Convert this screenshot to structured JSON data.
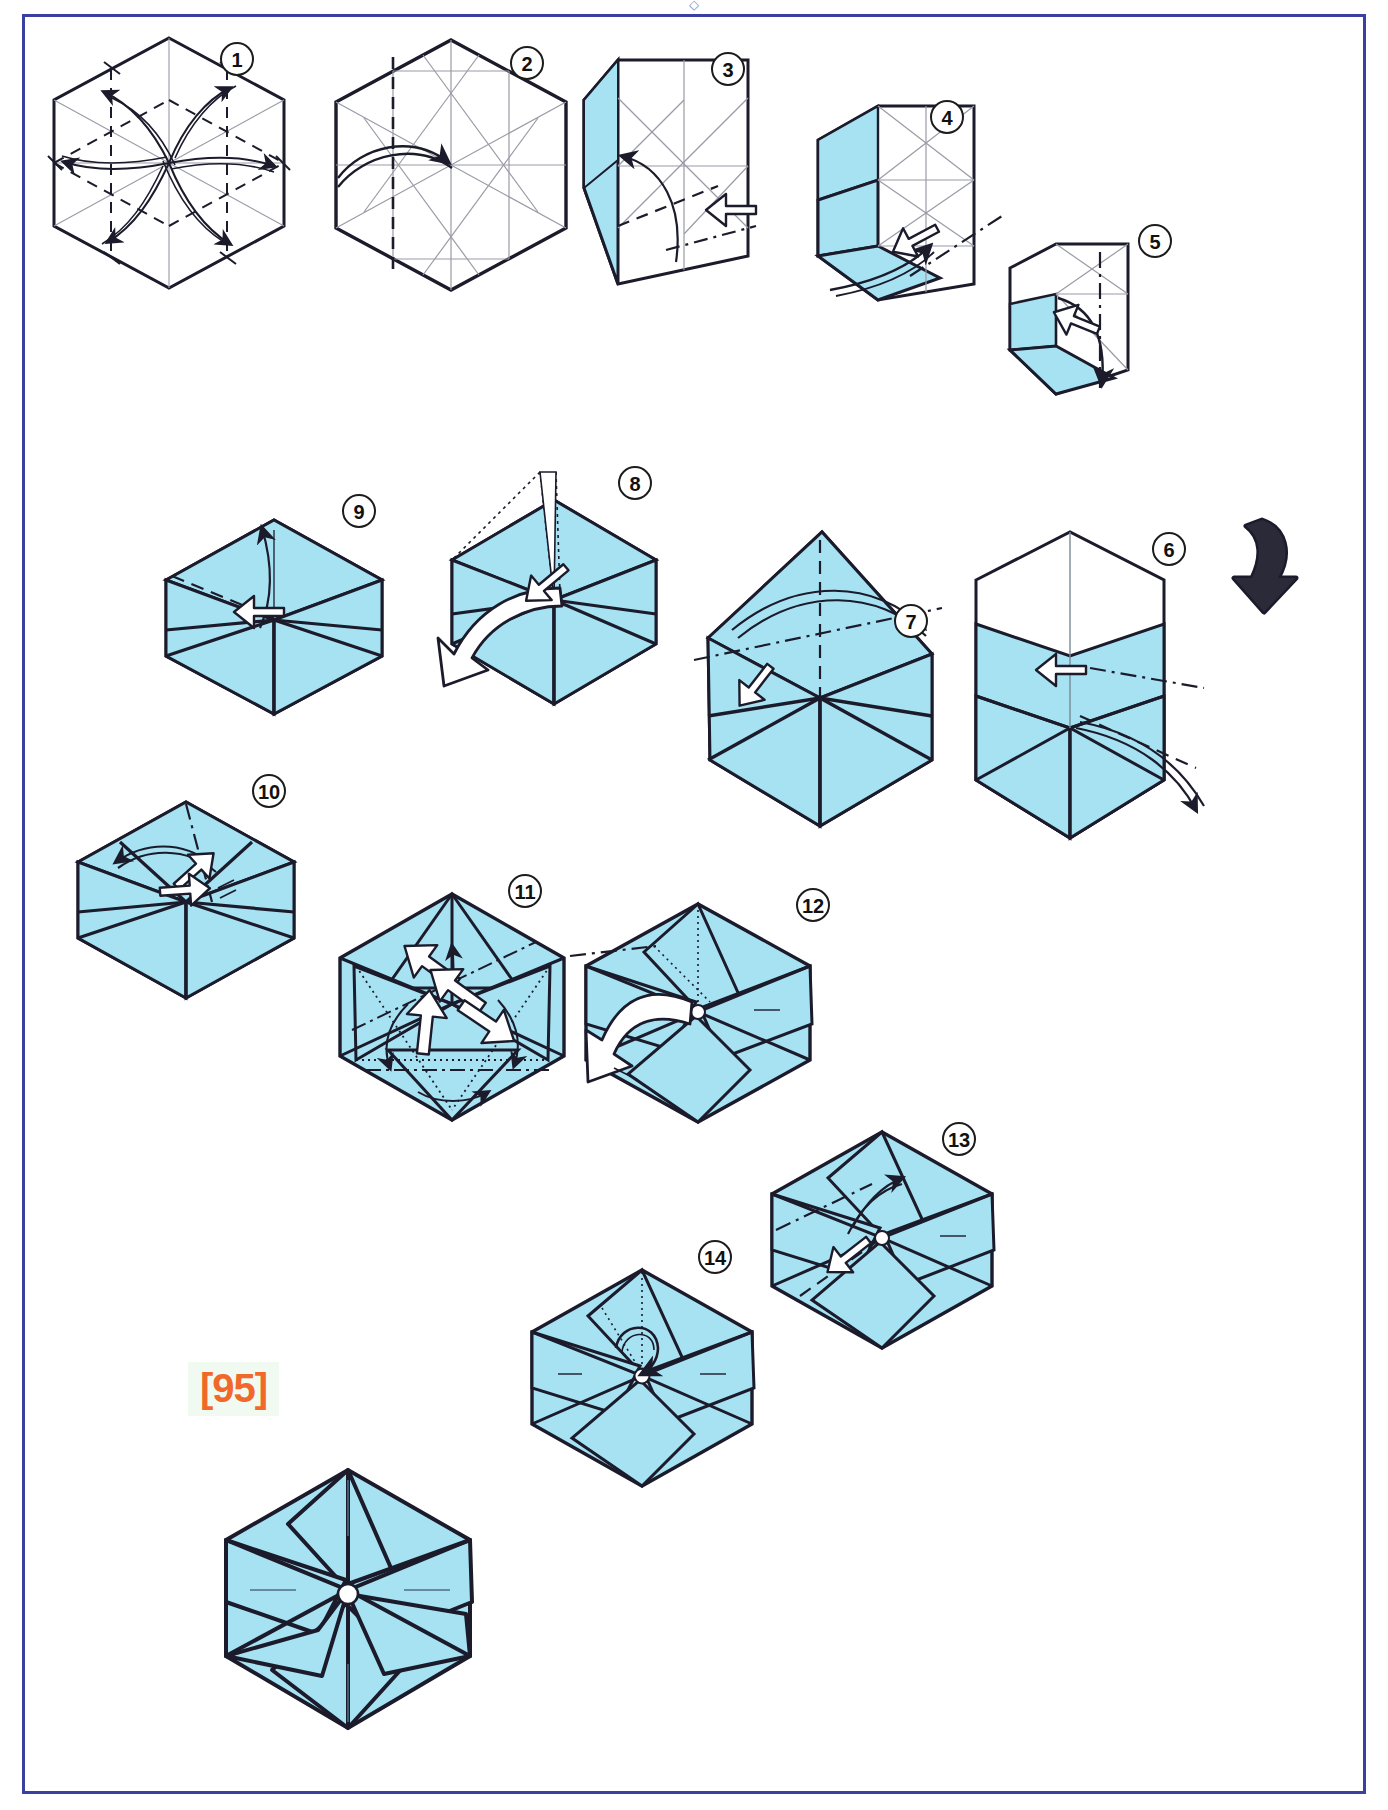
{
  "document": {
    "type": "origami-diagram-page",
    "page_marker": "[95]",
    "page_marker_color": "#f0682a",
    "page_marker_highlight": "#f1faf1",
    "header_fragment": "◇",
    "frame_color": "#3b3fa0",
    "paper_color": "#a6e2f2",
    "paper_color_white": "#ffffff",
    "line_color": "#1b1b2b"
  },
  "steps": [
    {
      "number": "1",
      "name": "step-1",
      "shape": "hexagon",
      "face": "white",
      "creases": "full triangular grid with dashed mountain/valley precreases",
      "arrows": "six curved rotational pinwheel arrows around center",
      "description": "Precrease hexagon with six swirling folds"
    },
    {
      "number": "2",
      "name": "step-2",
      "shape": "hexagon",
      "face": "white",
      "creases": "triangular grid, one vertical dashed valley line",
      "arrows": "one curved arrow pointing right to center",
      "description": "Fold left vertical edge column in to the center"
    },
    {
      "number": "3",
      "name": "step-3",
      "shape": "hexagon with left column folded",
      "face": "cyan-left-panel",
      "creases": "dashed and dash-dot lines on folded panel",
      "arrows": "curved arrow up-left plus white push arrow from right",
      "description": "Fold the left panel over; push indicated point"
    },
    {
      "number": "4",
      "name": "step-4",
      "shape": "partially folded hexagon",
      "face": "cyan-upper-left",
      "creases": "dash-dot lines across lower band",
      "arrows": "curved arrow down-right plus white push arrow",
      "description": "Continue collapsing the lower band"
    },
    {
      "number": "5",
      "name": "step-5",
      "shape": "narrow folded rectangle",
      "face": "cyan lower band",
      "creases": "vertical dash-dot line at right",
      "arrows": "white push arrow plus curved arrow down",
      "description": "Collapse again; repeat around"
    },
    {
      "number": "6",
      "name": "step-6",
      "shape": "tall box form",
      "face": "cyan lower two thirds, white top",
      "creases": "dashed and dash-dot lines",
      "arrows": "white push arrow at upper middle, long curved arrow to right",
      "description": "Swing flap to the right"
    },
    {
      "number": "7",
      "name": "step-7",
      "shape": "hexagonal box",
      "face": "cyan",
      "creases": "dash-dot line across, vertical dashed line",
      "arrows": "white push arrow and long curved arrow to the right",
      "description": "Fold the upper flap over to the right"
    },
    {
      "number": "8",
      "name": "step-8",
      "shape": "hexagonal form with raised top flap",
      "face": "cyan",
      "creases": "dotted hidden lines at top-left flap",
      "arrows": "broad white curved arrow sweeping down-left, white push arrow",
      "description": "Swing the top flap down to the left"
    },
    {
      "number": "9",
      "name": "step-9",
      "shape": "hexagonal form",
      "face": "cyan",
      "creases": "dashed valley fold across upper-left",
      "arrows": "curved arrow rising upward, white push arrow at center",
      "description": "Lift the flap upward"
    },
    {
      "number": "10",
      "name": "step-10",
      "shape": "hexagon with folded flaps",
      "face": "cyan",
      "creases": "dash-dot line down from the top vertex",
      "arrows": "curved arrow to the left, white push arrow at center",
      "description": "Swing the point across to the left"
    },
    {
      "number": "11",
      "name": "step-11",
      "shape": "hexagon with triangular flaps",
      "face": "cyan",
      "creases": "dash-dot and dotted lines forming inner triangle",
      "arrows": "four white push arrows plus small curved arrows around the rim",
      "description": "Push all flaps simultaneously to swivel them"
    },
    {
      "number": "12",
      "name": "step-12",
      "shape": "hexagonal pinwheel",
      "face": "cyan",
      "creases": "dash-dot line at upper left, dotted guide",
      "arrows": "broad white curved arrow sweeping down-left",
      "description": "Rotate the flap around the center"
    },
    {
      "number": "13",
      "name": "step-13",
      "shape": "hexagonal pinwheel",
      "face": "cyan",
      "creases": "dashed and dash-dot lines on left side",
      "arrows": "curved arrow up, white push arrow",
      "description": "Repeat on the remaining flaps"
    },
    {
      "number": "14",
      "name": "step-14",
      "shape": "hexagonal pinwheel",
      "face": "cyan",
      "creases": "dotted hidden line at center",
      "arrows": "small looping arrow at center",
      "description": "Twist the center closed"
    },
    {
      "number": "",
      "name": "final-model",
      "shape": "six-pointed hexagonal pinwheel star",
      "face": "cyan",
      "creases": "none",
      "arrows": "none",
      "description": "Finished hexagonal pinwheel"
    }
  ],
  "big_arrow": {
    "name": "turn-over-arrow",
    "label": "",
    "direction": "down",
    "style": "solid black hooked arrow"
  }
}
